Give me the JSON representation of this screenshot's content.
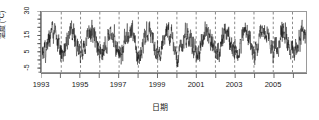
{
  "chart_data": {
    "type": "line",
    "title": "",
    "xlabel": "日期",
    "ylabel": "温度 (°C)",
    "grid": true,
    "legend_position": "none",
    "xlim": [
      1993.0,
      2006.7
    ],
    "ylim": [
      -8,
      30
    ],
    "x_tick_values": [
      1993,
      1994,
      1995,
      1996,
      1997,
      1998,
      1999,
      2000,
      2001,
      2002,
      2003,
      2004,
      2005,
      2006
    ],
    "x_tick_labels": [
      "1993",
      "",
      "1995",
      "",
      "1997",
      "",
      "1999",
      "",
      "2001",
      "",
      "2003",
      "",
      "2005",
      ""
    ],
    "y_tick_values": [
      30,
      25,
      20,
      15,
      10,
      5,
      0,
      -5
    ],
    "y_tick_labels": [
      "30",
      "",
      "",
      "15",
      "",
      "5",
      "",
      "-5"
    ],
    "series": [
      {
        "name": "日平均温度",
        "color": "#111111",
        "description": "Daily mean temperature, strongly seasonal with high day-to-day noise",
        "seasonal_mean_min": 4.0,
        "seasonal_mean_max": 17.5,
        "noise_amplitude": 5.5,
        "observed_min": -6.0,
        "observed_max": 25.0,
        "points_per_year": 120,
        "annual_peaks": [
          19.0,
          18.0,
          18.5,
          18.0,
          18.0,
          18.5,
          19.0,
          18.0,
          18.5,
          18.0,
          18.5,
          19.0,
          18.0,
          18.5
        ],
        "annual_troughs": [
          3.0,
          2.5,
          3.5,
          2.5,
          3.0,
          3.0,
          2.5,
          3.0,
          2.0,
          3.0,
          2.5,
          3.0,
          2.5,
          3.0
        ]
      }
    ],
    "gridline_years": [
      1994,
      1995,
      1996,
      1997,
      1998,
      1999,
      2000,
      2001,
      2002,
      2003,
      2004,
      2005,
      2006
    ],
    "gridline_style": "dashed",
    "gridline_color": "#555555"
  },
  "axis": {
    "y_label_30": "30",
    "y_label_15": "15",
    "y_label_5": "5",
    "y_label_neg5": "-5",
    "x_label_1993": "1993",
    "x_label_1995": "1995",
    "x_label_1997": "1997",
    "x_label_1999": "1999",
    "x_label_2001": "2001",
    "x_label_2003": "2003",
    "x_label_2005": "2005"
  },
  "figure": {
    "title": "",
    "background": "#ffffff",
    "frame_color": "#9a9a9a"
  }
}
